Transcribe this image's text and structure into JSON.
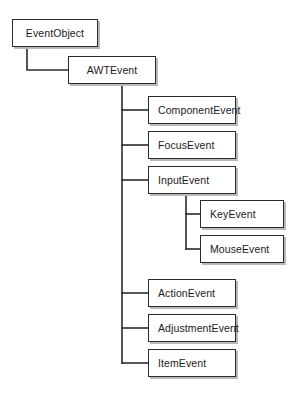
{
  "diagram": {
    "type": "class-hierarchy-tree",
    "background_color": "#ffffff",
    "box_border_color": "#2b2b2b",
    "box_fill_color": "#ffffff",
    "box_shadow_color": "#b9b9b9",
    "connector_color": "#2b2b2b",
    "text_color": "#1a1a1a",
    "nodes": [
      {
        "id": "event-object",
        "label": "EventObject",
        "x": 12,
        "y": 19,
        "w": 86,
        "h": 28,
        "align": "center",
        "level": 0,
        "parent": null
      },
      {
        "id": "awt-event",
        "label": "AWTEvent",
        "x": 68,
        "y": 56,
        "w": 88,
        "h": 28,
        "align": "center",
        "level": 1,
        "parent": "event-object"
      },
      {
        "id": "component-event",
        "label": "ComponentEvent",
        "x": 148,
        "y": 96,
        "w": 88,
        "h": 28,
        "align": "left",
        "level": 2,
        "parent": "awt-event"
      },
      {
        "id": "focus-event",
        "label": "FocusEvent",
        "x": 148,
        "y": 131,
        "w": 88,
        "h": 28,
        "align": "left",
        "level": 2,
        "parent": "awt-event"
      },
      {
        "id": "input-event",
        "label": "InputEvent",
        "x": 148,
        "y": 166,
        "w": 88,
        "h": 28,
        "align": "left",
        "level": 2,
        "parent": "awt-event"
      },
      {
        "id": "key-event",
        "label": "KeyEvent",
        "x": 200,
        "y": 200,
        "w": 84,
        "h": 28,
        "align": "left",
        "level": 3,
        "parent": "input-event"
      },
      {
        "id": "mouse-event",
        "label": "MouseEvent",
        "x": 200,
        "y": 235,
        "w": 84,
        "h": 28,
        "align": "left",
        "level": 3,
        "parent": "input-event"
      },
      {
        "id": "action-event",
        "label": "ActionEvent",
        "x": 148,
        "y": 279,
        "w": 88,
        "h": 28,
        "align": "left",
        "level": 2,
        "parent": "awt-event"
      },
      {
        "id": "adjustment-event",
        "label": "AdjustmentEvent",
        "x": 148,
        "y": 314,
        "w": 88,
        "h": 28,
        "align": "left",
        "level": 2,
        "parent": "awt-event"
      },
      {
        "id": "item-event",
        "label": "ItemEvent",
        "x": 148,
        "y": 349,
        "w": 88,
        "h": 28,
        "align": "left",
        "level": 2,
        "parent": "awt-event"
      }
    ],
    "connectors": [
      {
        "id": "conn-eventobject-awtevent",
        "from": "event-object",
        "to": "awt-event",
        "points": "27,47 27,70 68,70"
      },
      {
        "id": "conn-awtevent-trunk",
        "from": "awt-event",
        "to": "awt-event-children",
        "points": "122,84 122,363"
      },
      {
        "id": "conn-awtevent-componentevent",
        "from": "awt-event",
        "to": "component-event",
        "points": "122,110 148,110"
      },
      {
        "id": "conn-awtevent-focusevent",
        "from": "awt-event",
        "to": "focus-event",
        "points": "122,145 148,145"
      },
      {
        "id": "conn-awtevent-inputevent",
        "from": "awt-event",
        "to": "input-event",
        "points": "122,180 148,180"
      },
      {
        "id": "conn-awtevent-actionevent",
        "from": "awt-event",
        "to": "action-event",
        "points": "122,293 148,293"
      },
      {
        "id": "conn-awtevent-adjustmentevent",
        "from": "awt-event",
        "to": "adjustment-event",
        "points": "122,328 148,328"
      },
      {
        "id": "conn-awtevent-itemevent",
        "from": "awt-event",
        "to": "item-event",
        "points": "122,363 148,363"
      },
      {
        "id": "conn-inputevent-trunk",
        "from": "input-event",
        "to": "input-event-children",
        "points": "186,194 186,249"
      },
      {
        "id": "conn-inputevent-keyevent",
        "from": "input-event",
        "to": "key-event",
        "points": "186,214 200,214"
      },
      {
        "id": "conn-inputevent-mouseevent",
        "from": "input-event",
        "to": "mouse-event",
        "points": "186,249 200,249"
      }
    ]
  }
}
